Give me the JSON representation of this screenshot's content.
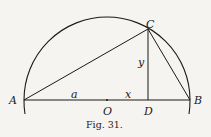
{
  "figure": {
    "caption": "Fig. 31.",
    "points": {
      "A": {
        "label": "A"
      },
      "B": {
        "label": "B"
      },
      "C": {
        "label": "C"
      },
      "D": {
        "label": "D"
      },
      "O": {
        "label": "O"
      }
    },
    "segment_labels": {
      "a": "a",
      "x": "x",
      "y": "y"
    },
    "colors": {
      "ink": "#1c1a18",
      "paper": "#f6f4f1"
    }
  }
}
